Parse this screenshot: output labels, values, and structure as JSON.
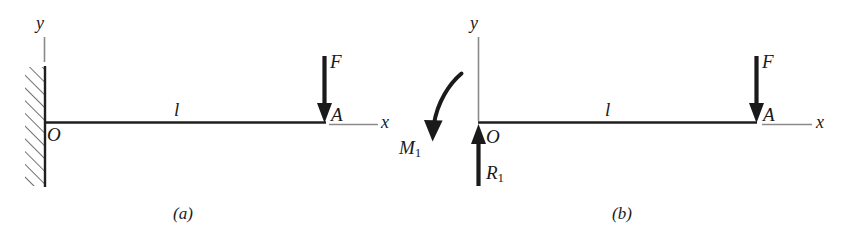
{
  "figure": {
    "background_color": "#ffffff",
    "ink_color": "#1a1a1a",
    "axis_color": "#7a7a7a",
    "panels": [
      {
        "key": "a",
        "caption": "(a)",
        "description": "Cantilever beam of length l fixed at wall at O with downward force F applied at free end A",
        "y_axis_label": "y",
        "x_axis_label": "x",
        "origin_label": "O",
        "free_end_label": "A",
        "length_label": "l",
        "force_label": "F",
        "support_type": "fixed-wall-hatched"
      },
      {
        "key": "b",
        "caption": "(b)",
        "description": "Free-body diagram with reaction force R1 upward at O, reaction moment M1 at O, and applied force F downward at A",
        "y_axis_label": "y",
        "x_axis_label": "x",
        "origin_label": "O",
        "free_end_label": "A",
        "length_label": "l",
        "force_label": "F",
        "reaction_force_label": "R",
        "reaction_force_subscript": "1",
        "reaction_moment_label": "M",
        "reaction_moment_subscript": "1",
        "support_type": "free-body"
      }
    ]
  }
}
